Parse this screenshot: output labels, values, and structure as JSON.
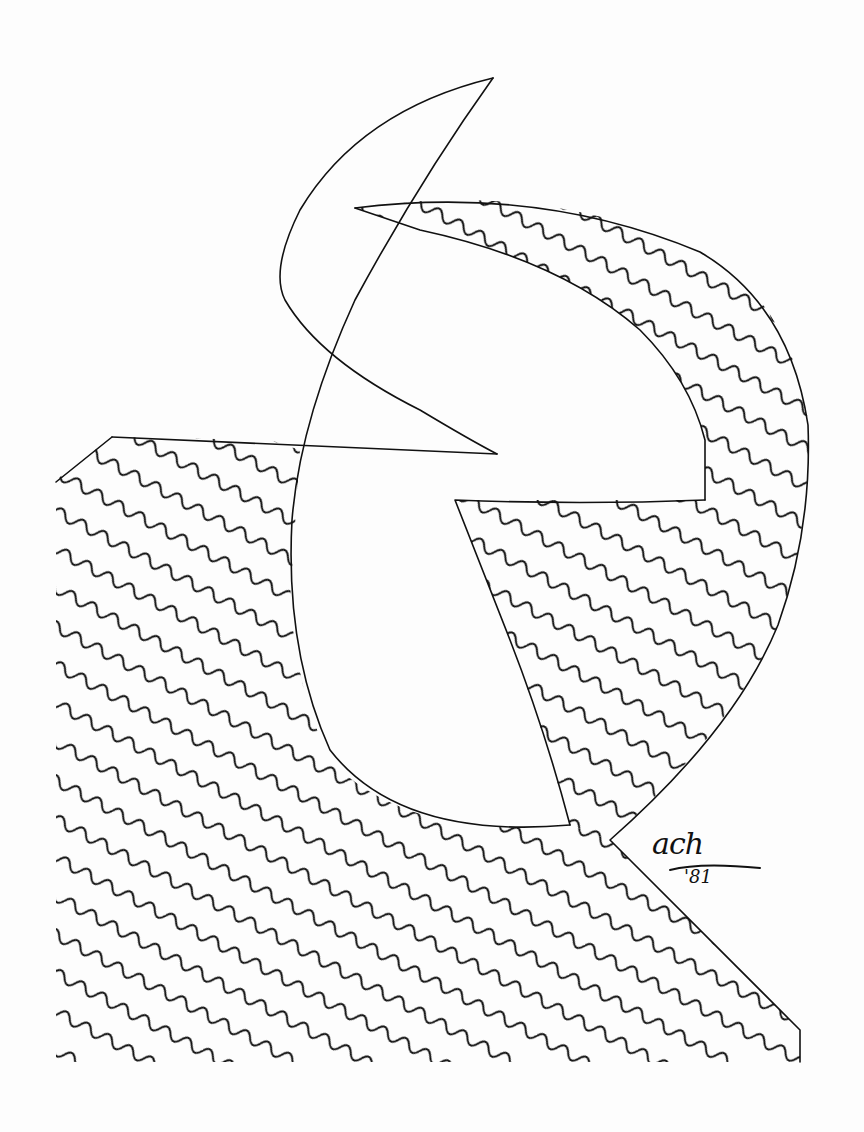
{
  "artwork": {
    "kind": "pen-and-ink line drawing",
    "subject": "abstract letterform with crescent and wavy-line hatching",
    "colors": {
      "ink": "#111111",
      "paper": "#fdfdfd"
    },
    "signature": {
      "name": "ach",
      "year": "'81"
    }
  }
}
